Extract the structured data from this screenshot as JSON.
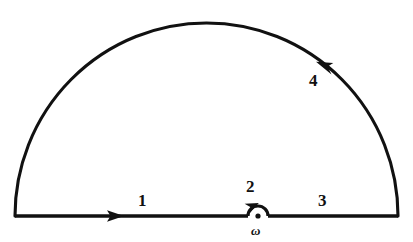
{
  "figure": {
    "kind": "contour-integration-diagram",
    "stroke_color": "#111111",
    "background_color": "#ffffff",
    "canvas": {
      "width": 413,
      "height": 242
    }
  },
  "geometry": {
    "baseline_y": 216,
    "left_endpoint_x": 15,
    "right_endpoint_x": 398,
    "arc_apex_y": 23,
    "arc_center_x": 206.5,
    "arc_radius_x": 191.5,
    "arc_radius_y": 193,
    "pole_x": 258,
    "pole_y": 216,
    "indent_radius": 10
  },
  "segments": [
    {
      "id": "segment-1",
      "label": "1",
      "kind": "straight",
      "direction": "rightward",
      "arrow_x": 117,
      "arrow_y": 216
    },
    {
      "id": "segment-2",
      "label": "2",
      "kind": "small-semicircle",
      "direction": "counterclockwise-over-pole",
      "arrow_x": 252,
      "arrow_y": 204
    },
    {
      "id": "segment-3",
      "label": "3",
      "kind": "straight",
      "direction": "rightward",
      "arrow_x": null,
      "arrow_y": null
    },
    {
      "id": "segment-4",
      "label": "4",
      "kind": "large-arc",
      "direction": "counterclockwise",
      "arrow_x": 323,
      "arrow_y": 66
    }
  ],
  "pole": {
    "label": "ω",
    "marker": "filled-dot",
    "marker_radius": 2.6
  },
  "labels": {
    "segment_1": "1",
    "segment_2": "2",
    "segment_3": "3",
    "segment_4": "4",
    "pole": "ω"
  }
}
